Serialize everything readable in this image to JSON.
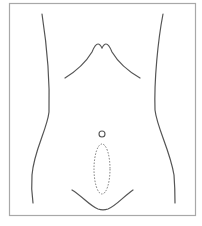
{
  "diagram": {
    "elements": [
      {
        "name": "frame-border",
        "type": "rectangle"
      },
      {
        "name": "left-flank",
        "type": "curve"
      },
      {
        "name": "right-flank",
        "type": "curve"
      },
      {
        "name": "costal-margin",
        "type": "curve"
      },
      {
        "name": "umbilicus",
        "type": "circle"
      },
      {
        "name": "lower-midline-incision-marker",
        "type": "dashed-ellipse"
      },
      {
        "name": "pubic-contour",
        "type": "curve"
      }
    ],
    "colors": {
      "stroke": "#555555",
      "border": "#a8a8a8",
      "dashed": "#777777",
      "background": "#ffffff"
    }
  }
}
